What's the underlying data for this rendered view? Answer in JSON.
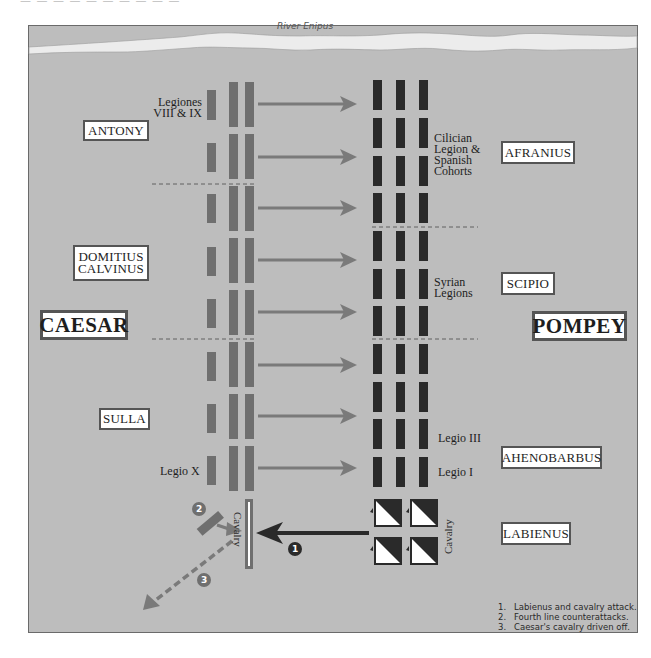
{
  "header": {
    "partial_text": "— — — — — — — — — —"
  },
  "map": {
    "river": {
      "label": "River Enipus"
    },
    "commanders": {
      "caesar_side": [
        {
          "id": "antony",
          "label": "ANTONY"
        },
        {
          "id": "domitius",
          "label": "DOMITIUS CALVINUS",
          "lines": [
            "DOMITIUS",
            "CALVINUS"
          ]
        },
        {
          "id": "caesar",
          "label": "CAESAR"
        },
        {
          "id": "sulla",
          "label": "SULLA"
        }
      ],
      "pompey_side": [
        {
          "id": "afranius",
          "label": "AFRANIUS"
        },
        {
          "id": "scipio",
          "label": "SCIPIO"
        },
        {
          "id": "pompey",
          "label": "POMPEY"
        },
        {
          "id": "ahenobarbus",
          "label": "AHENOBARBUS"
        },
        {
          "id": "labienus",
          "label": "LABIENUS"
        }
      ]
    },
    "unit_labels": {
      "legiones_viii_ix": [
        "Legiones",
        "VIII & IX"
      ],
      "cilician": [
        "Cilician",
        "Legion &",
        "Spanish",
        "Cohorts"
      ],
      "syrian": [
        "Syrian",
        "Legions"
      ],
      "legio_iii": "Legio III",
      "legio_i": "Legio I",
      "legio_x": "Legio X",
      "caesar_cavalry": "Cavalry",
      "pompey_cavalry": "Cavalry"
    },
    "markers": [
      {
        "id": "1",
        "label": "1"
      },
      {
        "id": "2",
        "label": "2"
      },
      {
        "id": "3",
        "label": "3"
      }
    ],
    "colors": {
      "ground": "#bdbdbd",
      "river": "#ececec",
      "caesar_units": "#6f6f6f",
      "pompey_units": "#2a2a2a",
      "arrows": "#7a7a7a",
      "cavalry_attack_arrow": "#2a2a2a"
    }
  },
  "legend": {
    "items": [
      {
        "num": "1.",
        "text": "Labienus and cavalry attack."
      },
      {
        "num": "2.",
        "text": "Fourth line counterattacks."
      },
      {
        "num": "3.",
        "text": "Caesar's cavalry driven off."
      }
    ]
  }
}
